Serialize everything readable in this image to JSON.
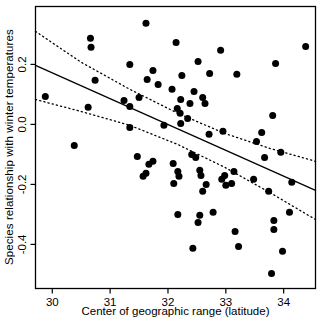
{
  "figure": {
    "background": "#ffffff",
    "border_color": "#000000"
  },
  "chart_data": {
    "type": "scatter",
    "title": "",
    "xlabel": "Center of geographic range (latitude)",
    "ylabel": "Species relationship with winter temperatures",
    "xlim": [
      29.71,
      34.55
    ],
    "ylim": [
      -0.547,
      0.393
    ],
    "x_ticks": {
      "values": [
        30,
        31,
        32,
        33,
        34
      ],
      "labels": [
        "30",
        "31",
        "32",
        "33",
        "34"
      ]
    },
    "y_ticks": {
      "values": [
        0.2,
        0.0,
        -0.2,
        -0.4
      ],
      "labels": [
        "0.2",
        "0.0",
        "-0.2",
        "-0.4"
      ]
    },
    "grid": false,
    "legend": "none",
    "marker": {
      "shape": "filled-circle",
      "color": "#000000",
      "radius_px": 3.5
    },
    "fit_line": {
      "style": "solid",
      "color": "#000000",
      "x": [
        29.71,
        34.55
      ],
      "y": [
        0.197,
        -0.22
      ]
    },
    "ci_upper": {
      "style": "dotted",
      "color": "#000000",
      "x": [
        29.71,
        30.5,
        31.34,
        32.17,
        32.98,
        33.76,
        34.55
      ],
      "y": [
        0.31,
        0.207,
        0.117,
        0.037,
        -0.03,
        -0.08,
        -0.123
      ]
    },
    "ci_lower": {
      "style": "dotted",
      "color": "#000000",
      "x": [
        29.71,
        30.5,
        31.34,
        32.17,
        32.98,
        33.76,
        34.55
      ],
      "y": [
        0.083,
        0.043,
        -0.003,
        -0.067,
        -0.143,
        -0.227,
        -0.317
      ]
    },
    "points": [
      [
        30.66,
        0.287
      ],
      [
        30.67,
        0.257
      ],
      [
        31.34,
        0.2
      ],
      [
        30.74,
        0.147
      ],
      [
        29.88,
        0.093
      ],
      [
        31.24,
        0.08
      ],
      [
        31.34,
        0.06
      ],
      [
        30.62,
        0.057
      ],
      [
        30.38,
        -0.07
      ],
      [
        31.62,
        0.337
      ],
      [
        32.14,
        0.273
      ],
      [
        32.91,
        0.247
      ],
      [
        32.52,
        0.21
      ],
      [
        31.74,
        0.18
      ],
      [
        32.24,
        0.163
      ],
      [
        31.64,
        0.15
      ],
      [
        32.72,
        0.17
      ],
      [
        31.83,
        0.133
      ],
      [
        32.07,
        0.117
      ],
      [
        32.45,
        0.11
      ],
      [
        31.5,
        0.09
      ],
      [
        32.6,
        0.09
      ],
      [
        32.22,
        0.083
      ],
      [
        32.38,
        0.07
      ],
      [
        32.64,
        0.07
      ],
      [
        32.16,
        0.053
      ],
      [
        32.21,
        0.037
      ],
      [
        32.34,
        0.02
      ],
      [
        31.93,
        -0.003
      ],
      [
        32.22,
        0.003
      ],
      [
        32.71,
        -0.033
      ],
      [
        32.95,
        -0.023
      ],
      [
        31.34,
        -0.01
      ],
      [
        34.38,
        0.26
      ],
      [
        33.86,
        0.203
      ],
      [
        33.19,
        0.167
      ],
      [
        33.81,
        0.03
      ],
      [
        33.62,
        -0.027
      ],
      [
        33.53,
        -0.057
      ],
      [
        33.95,
        -0.093
      ],
      [
        31.47,
        -0.107
      ],
      [
        31.67,
        -0.133
      ],
      [
        31.74,
        -0.123
      ],
      [
        31.62,
        -0.163
      ],
      [
        31.57,
        -0.173
      ],
      [
        32.09,
        -0.13
      ],
      [
        32.17,
        -0.157
      ],
      [
        32.19,
        -0.173
      ],
      [
        32.1,
        -0.197
      ],
      [
        32.41,
        -0.1
      ],
      [
        32.48,
        -0.11
      ],
      [
        32.55,
        -0.153
      ],
      [
        32.57,
        -0.17
      ],
      [
        32.66,
        -0.2
      ],
      [
        32.6,
        -0.223
      ],
      [
        32.17,
        -0.3
      ],
      [
        32.55,
        -0.303
      ],
      [
        32.78,
        -0.293
      ],
      [
        32.52,
        -0.327
      ],
      [
        33.67,
        -0.11
      ],
      [
        33.14,
        -0.157
      ],
      [
        32.98,
        -0.17
      ],
      [
        32.93,
        -0.183
      ],
      [
        33.1,
        -0.197
      ],
      [
        33.0,
        -0.203
      ],
      [
        33.48,
        -0.183
      ],
      [
        33.74,
        -0.223
      ],
      [
        34.14,
        -0.193
      ],
      [
        34.1,
        -0.293
      ],
      [
        33.83,
        -0.32
      ],
      [
        33.83,
        -0.35
      ],
      [
        33.16,
        -0.357
      ],
      [
        33.22,
        -0.407
      ],
      [
        33.98,
        -0.423
      ],
      [
        32.43,
        -0.413
      ],
      [
        33.79,
        -0.497
      ]
    ]
  }
}
